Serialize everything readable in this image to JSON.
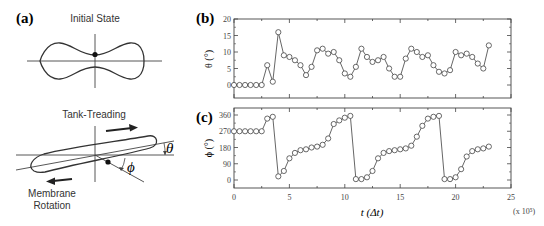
{
  "panels": {
    "a": {
      "label": "(a)",
      "initial_state_title": "Initial State",
      "tank_treading_title": "Tank-Treading",
      "membrane_rotation_line1": "Membrane",
      "membrane_rotation_line2": "Rotation",
      "theta_symbol": "θ",
      "phi_symbol": "ϕ"
    },
    "b": {
      "label": "(b)",
      "ylabel": "θ (°)"
    },
    "c": {
      "label": "(c)",
      "ylabel": "ϕ (°)"
    }
  },
  "xaxis": {
    "label": "t (Δt)",
    "multiplier": "(x 10⁵)"
  },
  "colors": {
    "line": "#555555",
    "frame": "#444444",
    "text": "#222222"
  },
  "chart_data": [
    {
      "type": "line",
      "panel": "(b)",
      "title": "",
      "xlabel": "t (Δt)",
      "xunit_multiplier": "x 10^5",
      "ylabel": "θ (°)",
      "xlim": [
        0,
        25
      ],
      "ylim": [
        -4,
        20
      ],
      "xticks": [
        0,
        5,
        10,
        15,
        20,
        25
      ],
      "yticks": [
        0,
        5,
        10,
        15,
        20
      ],
      "marker": "open-circle",
      "x": [
        0,
        0.5,
        1,
        1.5,
        2,
        2.5,
        3,
        3.5,
        4,
        4.5,
        5,
        5.5,
        6,
        6.5,
        7,
        7.5,
        8,
        8.5,
        9,
        9.5,
        10,
        10.5,
        11,
        11.5,
        12,
        12.5,
        13,
        13.5,
        14,
        14.5,
        15,
        15.5,
        16,
        16.5,
        17,
        17.5,
        18,
        18.5,
        19,
        19.5,
        20,
        20.5,
        21,
        21.5,
        22,
        22.5,
        23
      ],
      "y": [
        0,
        0,
        0,
        0,
        0,
        0,
        6,
        1,
        16,
        9,
        8.5,
        7.5,
        6,
        3,
        5.5,
        10.5,
        11,
        9.5,
        10,
        7.5,
        3.5,
        2.5,
        5.5,
        11,
        8.5,
        7,
        7.5,
        8.5,
        5,
        2.5,
        2.5,
        8,
        11,
        10,
        8.5,
        9,
        6,
        4,
        3.5,
        4.5,
        10,
        9,
        9.5,
        8.5,
        6.5,
        5,
        12
      ]
    },
    {
      "type": "line",
      "panel": "(c)",
      "title": "",
      "xlabel": "t (Δt)",
      "xunit_multiplier": "x 10^5",
      "ylabel": "ϕ (°)",
      "xlim": [
        0,
        25
      ],
      "ylim": [
        -20,
        380
      ],
      "xticks": [
        0,
        5,
        10,
        15,
        20,
        25
      ],
      "yticks": [
        0,
        90,
        180,
        270,
        360
      ],
      "marker": "open-circle",
      "x": [
        0,
        0.5,
        1,
        1.5,
        2,
        2.5,
        3,
        3.5,
        4,
        4.5,
        5,
        5.5,
        6,
        6.5,
        7,
        7.5,
        8,
        8.5,
        9,
        9.5,
        10,
        10.5,
        11,
        11.5,
        12,
        12.5,
        13,
        13.5,
        14,
        14.5,
        15,
        15.5,
        16,
        16.5,
        17,
        17.5,
        18,
        18.5,
        19,
        19.5,
        20,
        20.5,
        21,
        21.5,
        22,
        22.5,
        23
      ],
      "y": [
        270,
        270,
        270,
        270,
        270,
        270,
        340,
        350,
        20,
        50,
        120,
        150,
        165,
        170,
        180,
        185,
        195,
        230,
        310,
        330,
        345,
        355,
        5,
        5,
        15,
        50,
        120,
        150,
        160,
        165,
        170,
        175,
        190,
        240,
        300,
        340,
        350,
        355,
        5,
        5,
        15,
        60,
        130,
        160,
        170,
        175,
        185
      ]
    }
  ]
}
